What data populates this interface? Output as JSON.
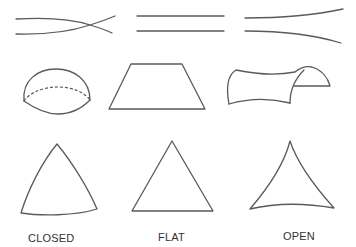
{
  "diagram": {
    "title": "",
    "columns": [
      {
        "id": "closed",
        "label": "CLOSED",
        "lines": "converging",
        "surface": "sphere",
        "triangle": "convex"
      },
      {
        "id": "flat",
        "label": "FLAT",
        "lines": "parallel",
        "surface": "plane",
        "triangle": "straight"
      },
      {
        "id": "open",
        "label": "OPEN",
        "lines": "diverging",
        "surface": "saddle",
        "triangle": "concave"
      }
    ],
    "colors": {
      "stroke": "#5a5a5a",
      "text": "#333333",
      "background": "#ffffff"
    }
  }
}
